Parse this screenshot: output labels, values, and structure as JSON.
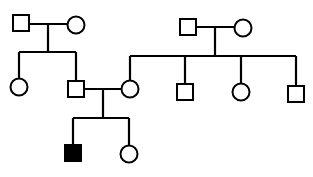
{
  "diagram": {
    "type": "pedigree",
    "line_color": "#000000",
    "affected_fill": "#000000",
    "unaffected_fill": "#ffffff",
    "individuals": [
      {
        "id": "I-1",
        "sex": "male",
        "affected": false,
        "shape": "square",
        "x": 21,
        "y": 23
      },
      {
        "id": "I-2",
        "sex": "female",
        "affected": false,
        "shape": "circle",
        "x": 76,
        "y": 25
      },
      {
        "id": "I-3",
        "sex": "male",
        "affected": false,
        "shape": "square",
        "x": 188,
        "y": 27
      },
      {
        "id": "I-4",
        "sex": "female",
        "affected": false,
        "shape": "circle",
        "x": 243,
        "y": 28
      },
      {
        "id": "II-1",
        "sex": "female",
        "affected": false,
        "shape": "circle",
        "x": 19,
        "y": 87
      },
      {
        "id": "II-2",
        "sex": "male",
        "affected": false,
        "shape": "square",
        "x": 76,
        "y": 89
      },
      {
        "id": "II-3",
        "sex": "female",
        "affected": false,
        "shape": "circle",
        "x": 130,
        "y": 89
      },
      {
        "id": "II-4",
        "sex": "male",
        "affected": false,
        "shape": "square",
        "x": 185,
        "y": 92
      },
      {
        "id": "II-5",
        "sex": "female",
        "affected": false,
        "shape": "circle",
        "x": 241,
        "y": 92
      },
      {
        "id": "II-6",
        "sex": "male",
        "affected": false,
        "shape": "square",
        "x": 296,
        "y": 94
      },
      {
        "id": "III-1",
        "sex": "male",
        "affected": true,
        "shape": "square",
        "x": 73,
        "y": 153
      },
      {
        "id": "III-2",
        "sex": "female",
        "affected": false,
        "shape": "circle",
        "x": 129,
        "y": 154
      }
    ]
  }
}
